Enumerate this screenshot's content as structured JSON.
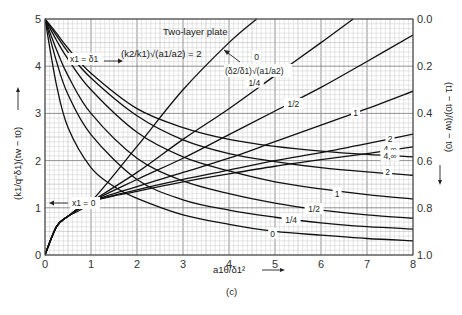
{
  "chart_data": {
    "type": "line",
    "title": "Two-layer plate",
    "subtitle": "(k2/k1)√(a1/a2) = 2",
    "panel_label": "(c)",
    "xlabel": "a1θ/δ1²",
    "ylabel_left": "(k1/q''δ1)(tw − t0)",
    "ylabel_right": "(t1 − t0)/(tw − t0)",
    "xlim": [
      0,
      8
    ],
    "ylim_left": [
      0,
      5
    ],
    "ylim_right": [
      1.0,
      0.0
    ],
    "x_ticks": [
      "0",
      "1",
      "2",
      "3",
      "4",
      "5",
      "6",
      "7",
      "8"
    ],
    "y_ticks_left": [
      "0",
      "1",
      "2",
      "3",
      "4",
      "5"
    ],
    "y_ticks_right": [
      "1.0",
      "0.8",
      "0.6",
      "0.4",
      "0.2",
      "0.0"
    ],
    "grid": true,
    "parameter_label": "(δ2/δ1)√(a1/a2)",
    "annotations": {
      "x1_delta": "x1 = δ1",
      "x1_zero": "x1 = 0"
    },
    "series": [
      {
        "name": "x1=0, 0",
        "group": "x1=0",
        "x": [
          0,
          0.25,
          0.5,
          1,
          2,
          3,
          4,
          4.6
        ],
        "y": [
          0,
          0.6,
          0.82,
          1.13,
          2.3,
          3.5,
          4.5,
          5.0
        ]
      },
      {
        "name": "x1=0, 1/4",
        "group": "x1=0",
        "x": [
          0,
          0.25,
          0.5,
          1,
          2,
          3,
          4,
          5,
          6,
          6.7
        ],
        "y": [
          0,
          0.6,
          0.82,
          1.13,
          1.75,
          2.45,
          3.1,
          3.8,
          4.5,
          5.0
        ]
      },
      {
        "name": "x1=0, 1/2",
        "group": "x1=0",
        "x": [
          0,
          0.25,
          0.5,
          1,
          2,
          3,
          4,
          5,
          6,
          7,
          8
        ],
        "y": [
          0,
          0.6,
          0.82,
          1.13,
          1.6,
          2.05,
          2.55,
          3.05,
          3.55,
          4.1,
          4.66
        ]
      },
      {
        "name": "x1=0, 1",
        "group": "x1=0",
        "x": [
          0,
          0.25,
          0.5,
          1,
          2,
          3,
          4,
          5,
          6,
          7,
          8
        ],
        "y": [
          0,
          0.6,
          0.82,
          1.13,
          1.45,
          1.75,
          2.05,
          2.4,
          2.75,
          3.1,
          3.47
        ]
      },
      {
        "name": "x1=0, 2",
        "group": "x1=0",
        "x": [
          0,
          0.25,
          0.5,
          1,
          2,
          3,
          4,
          5,
          6,
          7,
          8
        ],
        "y": [
          0,
          0.6,
          0.82,
          1.13,
          1.38,
          1.6,
          1.8,
          2.0,
          2.17,
          2.36,
          2.56
        ]
      },
      {
        "name": "x1=0, 4,∞",
        "group": "x1=0",
        "x": [
          0,
          0.25,
          0.5,
          1,
          2,
          3,
          4,
          5,
          6,
          7,
          8
        ],
        "y": [
          0,
          0.6,
          0.82,
          1.13,
          1.35,
          1.55,
          1.72,
          1.88,
          2.02,
          2.15,
          2.29
        ]
      },
      {
        "name": "x1=δ1, 0",
        "group": "x1=δ1",
        "x": [
          0,
          0.25,
          0.5,
          1,
          1.5,
          2,
          3,
          4,
          5,
          6,
          7,
          8
        ],
        "y": [
          5,
          3.6,
          2.7,
          1.85,
          1.45,
          1.2,
          0.85,
          0.65,
          0.5,
          0.42,
          0.35,
          0.3
        ]
      },
      {
        "name": "x1=δ1, 1/4",
        "group": "x1=δ1",
        "x": [
          0,
          0.25,
          0.5,
          1,
          2,
          3,
          4,
          5,
          6,
          7,
          8
        ],
        "y": [
          5,
          4.1,
          3.4,
          2.55,
          1.6,
          1.17,
          0.95,
          0.8,
          0.68,
          0.6,
          0.55
        ]
      },
      {
        "name": "x1=δ1, 1/2",
        "group": "x1=δ1",
        "x": [
          0,
          0.25,
          0.5,
          1,
          2,
          3,
          4,
          5,
          6,
          7,
          8
        ],
        "y": [
          5,
          4.35,
          3.8,
          3.0,
          2.05,
          1.57,
          1.3,
          1.1,
          0.95,
          0.85,
          0.78
        ]
      },
      {
        "name": "x1=δ1, 1",
        "group": "x1=δ1",
        "x": [
          0,
          0.25,
          0.5,
          1,
          2,
          3,
          4,
          5,
          6,
          7,
          8
        ],
        "y": [
          5,
          4.55,
          4.15,
          3.5,
          2.6,
          2.08,
          1.78,
          1.55,
          1.4,
          1.28,
          1.19
        ]
      },
      {
        "name": "x1=δ1, 2",
        "group": "x1=δ1",
        "x": [
          0,
          0.25,
          0.5,
          1,
          2,
          3,
          4,
          5,
          6,
          7,
          8
        ],
        "y": [
          5,
          4.65,
          4.3,
          3.75,
          2.95,
          2.44,
          2.15,
          1.98,
          1.85,
          1.76,
          1.69
        ]
      },
      {
        "name": "x1=δ1, 4,∞",
        "group": "x1=δ1",
        "x": [
          0,
          0.25,
          0.5,
          1,
          2,
          3,
          4,
          5,
          6,
          7,
          8
        ],
        "y": [
          5,
          4.7,
          4.38,
          3.85,
          3.1,
          2.7,
          2.45,
          2.3,
          2.2,
          2.13,
          2.08
        ]
      }
    ],
    "curve_labels": [
      {
        "text": "0",
        "x": 4.6,
        "y": 4.2
      },
      {
        "text": "1/4",
        "x": 4.55,
        "y": 3.65
      },
      {
        "text": "1/2",
        "x": 5.4,
        "y": 3.2
      },
      {
        "text": "1",
        "x": 6.75,
        "y": 3.0
      },
      {
        "text": "2",
        "x": 7.5,
        "y": 2.45
      },
      {
        "text": "4,∞",
        "x": 7.5,
        "y": 2.25
      },
      {
        "text": "4,∞",
        "x": 7.5,
        "y": 2.1
      },
      {
        "text": "2",
        "x": 7.45,
        "y": 1.75
      },
      {
        "text": "1",
        "x": 6.35,
        "y": 1.3
      },
      {
        "text": "1/2",
        "x": 5.85,
        "y": 0.97
      },
      {
        "text": "1/4",
        "x": 5.35,
        "y": 0.75
      },
      {
        "text": "0",
        "x": 4.95,
        "y": 0.45
      }
    ]
  }
}
